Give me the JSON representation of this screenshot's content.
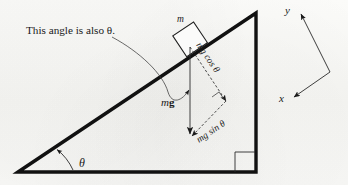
{
  "figure": {
    "type": "physics-free-body-diagram",
    "background_color": "#f7f7f5",
    "ink_color": "#1a1a1a",
    "callout": {
      "text": "This angle is also θ.",
      "points_to": "angle-between-weight-and-normal-direction"
    },
    "incline": {
      "angle_label": "θ",
      "right_angle_marker": true,
      "vertices": {
        "bottom_left": [
          18,
          172
        ],
        "apex_top_right": [
          256,
          13
        ],
        "bottom_right": [
          256,
          172
        ]
      }
    },
    "block": {
      "label": "m",
      "description": "square block resting on the incline surface"
    },
    "vectors": [
      {
        "name": "weight",
        "label_italic": "m",
        "label_bold": "g",
        "label_full": "mg",
        "style": "solid",
        "direction": "straight down",
        "arrowhead": true
      },
      {
        "name": "normal-component",
        "label": "mg cos θ",
        "style": "dashed",
        "direction": "perpendicular into the incline surface",
        "arrowhead": true
      },
      {
        "name": "parallel-component",
        "label": "mg sin θ",
        "style": "dashed",
        "direction": "down the slope, parallel to the incline surface",
        "arrowhead": true
      }
    ],
    "axes": {
      "x_label": "x",
      "y_label": "y",
      "description": "tilted coordinate axes aligned with the incline; y points up-right (normal to slope), x points down-left (down the slope)",
      "origin": [
        330,
        72
      ],
      "x_tip": [
        292,
        98
      ],
      "y_tip": [
        299,
        12
      ]
    }
  }
}
